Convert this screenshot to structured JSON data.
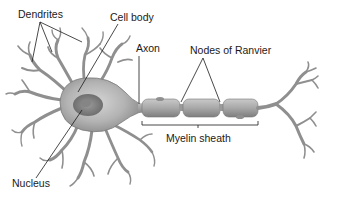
{
  "diagram": {
    "labels": {
      "dendrites": "Dendrites",
      "cell_body": "Cell body",
      "axon": "Axon",
      "nodes_of_ranvier": "Nodes of Ranvier",
      "nucleus": "Nucleus",
      "myelin_sheath": "Myelin sheath"
    },
    "colors": {
      "background": "#ffffff",
      "cell_fill": "#b8b8b8",
      "cell_shadow": "#8a8a8a",
      "nucleus_fill": "#7a7a7a",
      "myelin_fill": "#a9a9a9",
      "leader_line": "#1a1a1a",
      "text": "#1a1a1a"
    }
  }
}
